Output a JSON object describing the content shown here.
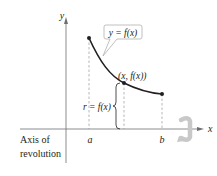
{
  "diagram": {
    "axes": {
      "x_label": "x",
      "y_label": "y"
    },
    "callout": {
      "text": "y = f(x)"
    },
    "point_label": "(x, f(x))",
    "radius_label": "r = f(x)",
    "ticks": {
      "a": "a",
      "b": "b"
    },
    "axis_of_revolution": {
      "line1": "Axis of",
      "line2": "revolution"
    },
    "colors": {
      "ink": "#231f20",
      "dashed": "#9a9a9a",
      "rotation_arrow": "#c8c8c8",
      "callout_border": "#b0b0b0"
    }
  }
}
